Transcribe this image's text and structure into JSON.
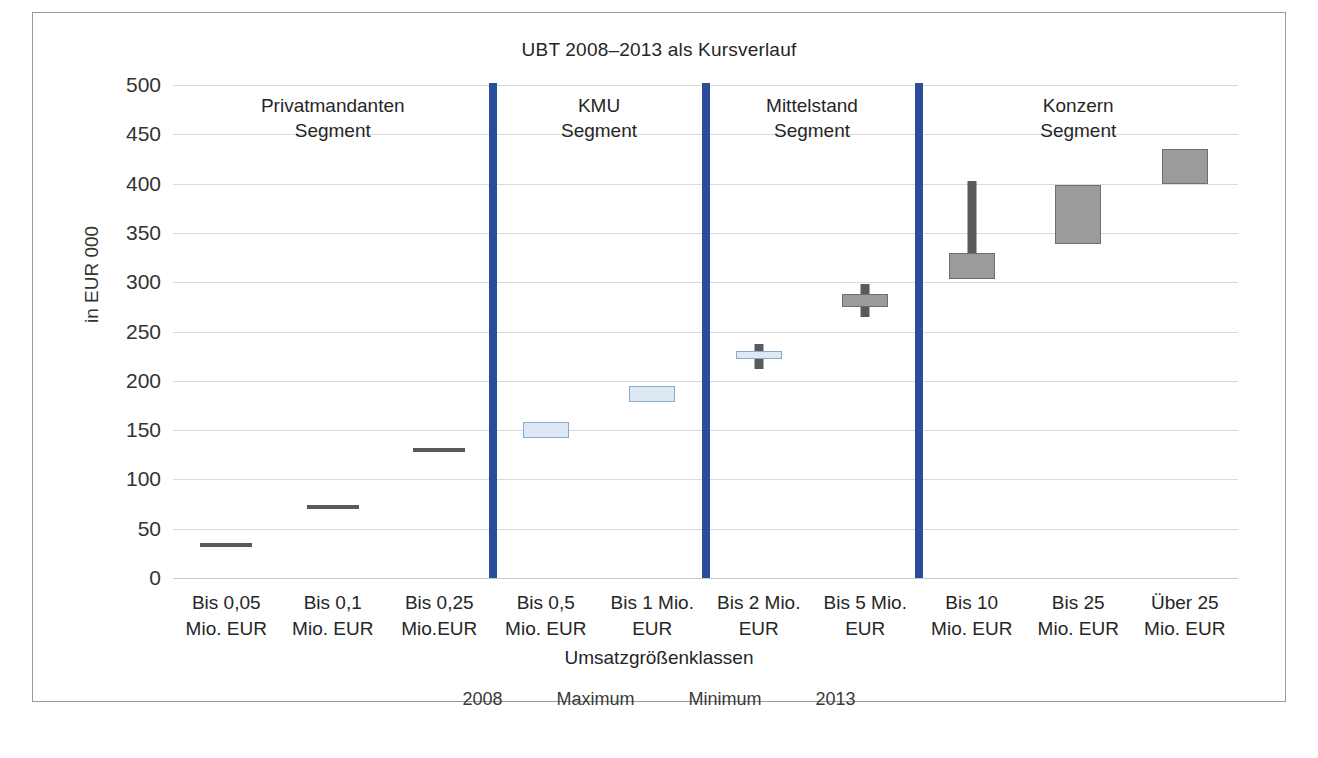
{
  "chart_data": {
    "type": "bar",
    "title": "UBT 2008–2013 als Kursverlauf",
    "xlabel": "Umsatzgrößenklassen",
    "ylabel": "in EUR 000",
    "ylim": [
      0,
      500
    ],
    "yticks": [
      0,
      50,
      100,
      150,
      200,
      250,
      300,
      350,
      400,
      450,
      500
    ],
    "grid": true,
    "legend_position": "bottom",
    "legend": [
      "2008",
      "Maximum",
      "Minimum",
      "2013"
    ],
    "categories": [
      "Bis 0,05 Mio. EUR",
      "Bis 0,1 Mio. EUR",
      "Bis 0,25 Mio.EUR",
      "Bis 0,5 Mio. EUR",
      "Bis 1 Mio. EUR",
      "Bis 2 Mio. EUR",
      "Bis 5 Mio. EUR",
      "Bis 10 Mio. EUR",
      "Bis 25 Mio. EUR",
      "Über 25 Mio. EUR"
    ],
    "category_lines": [
      [
        "Bis 0,05",
        "Mio. EUR"
      ],
      [
        "Bis 0,1",
        "Mio. EUR"
      ],
      [
        "Bis 0,25",
        "Mio.EUR"
      ],
      [
        "Bis 0,5",
        "Mio. EUR"
      ],
      [
        "Bis 1 Mio.",
        "EUR"
      ],
      [
        "Bis 2 Mio.",
        "EUR"
      ],
      [
        "Bis 5 Mio.",
        "EUR"
      ],
      [
        "Bis 10",
        "Mio. EUR"
      ],
      [
        "Bis 25",
        "Mio. EUR"
      ],
      [
        "Über 25",
        "Mio. EUR"
      ]
    ],
    "series": [
      {
        "name": "2008",
        "values": [
          33,
          72,
          130,
          142,
          178,
          222,
          275,
          303,
          339,
          400
        ]
      },
      {
        "name": "Maximum",
        "values": [
          33,
          72,
          130,
          158,
          195,
          237,
          298,
          403,
          399,
          435
        ]
      },
      {
        "name": "Minimum",
        "values": [
          33,
          72,
          130,
          142,
          178,
          212,
          265,
          303,
          339,
          400
        ]
      },
      {
        "name": "2013",
        "values": [
          33,
          72,
          130,
          158,
          195,
          230,
          288,
          330,
          399,
          435
        ]
      }
    ],
    "points": [
      {
        "category": "Bis 0,05 Mio. EUR",
        "low": 33,
        "high": 33,
        "open": 33,
        "close": 33,
        "style": "flat",
        "color": "#595959"
      },
      {
        "category": "Bis 0,1 Mio. EUR",
        "low": 72,
        "high": 72,
        "open": 72,
        "close": 72,
        "style": "flat",
        "color": "#595959"
      },
      {
        "category": "Bis 0,25 Mio.EUR",
        "low": 130,
        "high": 130,
        "open": 130,
        "close": 130,
        "style": "flat",
        "color": "#595959"
      },
      {
        "category": "Bis 0,5 Mio. EUR",
        "low": 142,
        "high": 158,
        "open": 142,
        "close": 158,
        "style": "light",
        "color": "#dce9f5"
      },
      {
        "category": "Bis 1 Mio. EUR",
        "low": 178,
        "high": 195,
        "open": 178,
        "close": 195,
        "style": "light",
        "color": "#dce9f5"
      },
      {
        "category": "Bis 2 Mio. EUR",
        "low": 212,
        "high": 237,
        "open": 222,
        "close": 230,
        "style": "light",
        "color": "#dce9f5"
      },
      {
        "category": "Bis 5 Mio. EUR",
        "low": 265,
        "high": 298,
        "open": 275,
        "close": 288,
        "style": "dark",
        "color": "#9b9b9b"
      },
      {
        "category": "Bis 10 Mio. EUR",
        "low": 303,
        "high": 403,
        "open": 303,
        "close": 330,
        "style": "dark",
        "color": "#9b9b9b"
      },
      {
        "category": "Bis 25 Mio. EUR",
        "low": 339,
        "high": 399,
        "open": 339,
        "close": 399,
        "style": "dark",
        "color": "#9b9b9b"
      },
      {
        "category": "Über 25 Mio. EUR",
        "low": 400,
        "high": 435,
        "open": 400,
        "close": 435,
        "style": "dark",
        "color": "#9b9b9b"
      }
    ],
    "segments": [
      {
        "label_line1": "Privatmandanten",
        "label_line2": "Segment",
        "from": 0,
        "to": 2
      },
      {
        "label_line1": "KMU",
        "label_line2": "Segment",
        "from": 3,
        "to": 4
      },
      {
        "label_line1": "Mittelstand",
        "label_line2": "Segment",
        "from": 5,
        "to": 6
      },
      {
        "label_line1": "Konzern",
        "label_line2": "Segment",
        "from": 7,
        "to": 9
      }
    ],
    "colors": {
      "divider": "#2a4d9b",
      "grid": "#d9d9d9",
      "flat_marker": "#595959",
      "light_box_fill": "#dce9f5",
      "light_box_border": "#8ea9c4",
      "dark_box_fill": "#9b9b9b",
      "dark_box_border": "#6f6f6f",
      "wick": "#5a5a5a",
      "text": "#262626"
    }
  }
}
